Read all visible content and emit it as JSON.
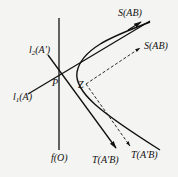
{
  "diagram": {
    "background": "#f4f4f2",
    "stroke_color": "#111111",
    "labels": {
      "s_ab_top": "S(AB)",
      "s_ab_dashed": "S(AB)",
      "l2": "l2(A')",
      "l1": "l1(A)",
      "p": "P",
      "z": "Z",
      "f": "f(O)",
      "t_solid": "T(A'B)",
      "t_dashed": "T(A'B)"
    },
    "label_parts": {
      "l2_main": "l",
      "l2_sub": "2",
      "l2_arg": "(A')",
      "l1_main": "l",
      "l1_sub": "1",
      "l1_arg": "(A)"
    }
  }
}
